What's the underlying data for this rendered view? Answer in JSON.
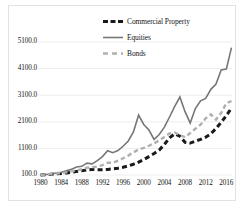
{
  "chart_data": {
    "type": "line",
    "title": "",
    "xlabel": "",
    "ylabel": "",
    "xlim": [
      1980,
      2017
    ],
    "ylim": [
      100,
      5100
    ],
    "grid": true,
    "grid_axis": "y",
    "legend_position": "top-center",
    "y_ticks": [
      "100.0",
      "1100.0",
      "2100.0",
      "3100.0",
      "4100.0",
      "5100.0"
    ],
    "y_tick_values": [
      100,
      1100,
      2100,
      3100,
      4100,
      5100
    ],
    "x_ticks": [
      "1980",
      "1984",
      "1988",
      "1992",
      "1996",
      "2000",
      "2004",
      "2008",
      "2012",
      "2016"
    ],
    "x_tick_values": [
      1980,
      1984,
      1988,
      1992,
      1996,
      2000,
      2004,
      2008,
      2012,
      2016
    ],
    "x": [
      1980,
      1981,
      1982,
      1983,
      1984,
      1985,
      1986,
      1987,
      1988,
      1989,
      1990,
      1991,
      1992,
      1993,
      1994,
      1995,
      1996,
      1997,
      1998,
      1999,
      2000,
      2001,
      2002,
      2003,
      2004,
      2005,
      2006,
      2007,
      2008,
      2009,
      2010,
      2011,
      2012,
      2013,
      2014,
      2015,
      2016,
      2017
    ],
    "series": [
      {
        "name": "Commercial Property",
        "color": "#1a1a1a",
        "style": "dashed",
        "width": 3.0,
        "values": [
          100,
          112,
          125,
          140,
          158,
          178,
          200,
          228,
          258,
          288,
          305,
          300,
          300,
          310,
          330,
          355,
          390,
          440,
          505,
          585,
          680,
          790,
          905,
          1040,
          1250,
          1500,
          1645,
          1560,
          1330,
          1300,
          1375,
          1440,
          1520,
          1650,
          1850,
          2080,
          2330,
          2620
        ]
      },
      {
        "name": "Equities",
        "color": "#777777",
        "style": "solid",
        "width": 1.6,
        "values": [
          100,
          118,
          135,
          175,
          205,
          255,
          320,
          400,
          425,
          545,
          520,
          640,
          790,
          1010,
          940,
          1020,
          1180,
          1380,
          1720,
          2350,
          2000,
          1790,
          1440,
          1620,
          1900,
          2280,
          2680,
          3030,
          2480,
          2050,
          2600,
          2890,
          2980,
          3320,
          3520,
          4050,
          4080,
          4890
        ]
      },
      {
        "name": "Bonds",
        "color": "#b0b0b0",
        "style": "dashed",
        "width": 2.4,
        "values": [
          100,
          115,
          132,
          152,
          172,
          200,
          235,
          275,
          315,
          375,
          390,
          420,
          470,
          560,
          560,
          640,
          730,
          830,
          950,
          1060,
          1120,
          1200,
          1290,
          1400,
          1530,
          1660,
          1700,
          1600,
          1520,
          1680,
          1840,
          1990,
          2230,
          2380,
          2180,
          2430,
          2800,
          2880
        ]
      }
    ]
  },
  "legend": {
    "items": [
      {
        "label": "Commercial Property",
        "swatch": "dashed-thick-black"
      },
      {
        "label": "Equities",
        "swatch": "solid-gray"
      },
      {
        "label": "Bonds",
        "swatch": "dashed-light-gray"
      }
    ]
  },
  "colors": {
    "commercial_property": "#1a1a1a",
    "equities": "#777777",
    "bonds": "#b0b0b0",
    "gridline": "#e8e8e8",
    "frame_border": "#e2e2e2",
    "text": "#141414",
    "background": "#ffffff"
  }
}
